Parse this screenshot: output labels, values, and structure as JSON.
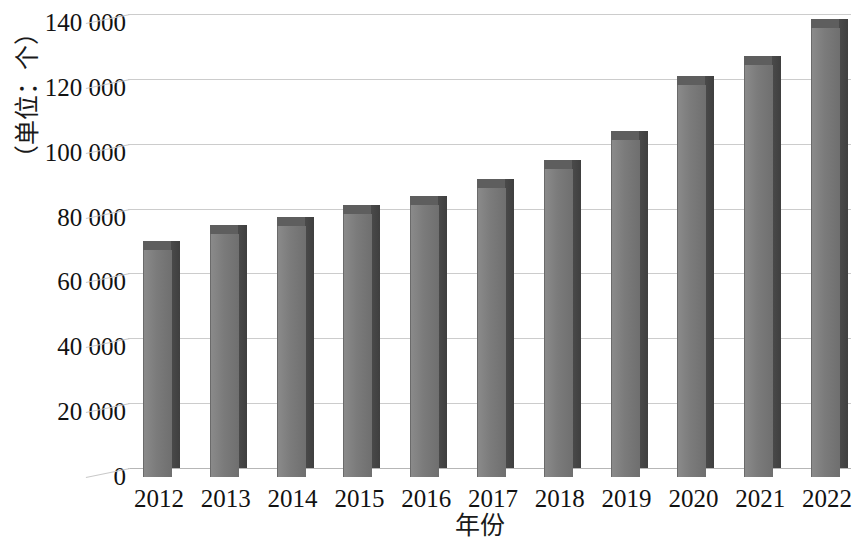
{
  "chart_data": {
    "type": "bar",
    "title": "",
    "xlabel": "年份",
    "ylabel": "（单位：个）",
    "categories": [
      "2012",
      "2013",
      "2014",
      "2015",
      "2016",
      "2017",
      "2018",
      "2019",
      "2020",
      "2021",
      "2022"
    ],
    "values": [
      70000,
      75000,
      77500,
      81000,
      84000,
      89000,
      95000,
      104000,
      121000,
      127000,
      138500
    ],
    "series": [
      {
        "name": "数量",
        "values": [
          70000,
          75000,
          77500,
          81000,
          84000,
          89000,
          95000,
          104000,
          121000,
          127000,
          138500
        ]
      }
    ],
    "ylim": [
      0,
      140000
    ],
    "ytick_values": [
      0,
      20000,
      40000,
      60000,
      80000,
      100000,
      120000,
      140000
    ],
    "ytick_labels": [
      "0",
      "20 000",
      "40 000",
      "60 000",
      "80 000",
      "100 000",
      "120 000",
      "140 000"
    ],
    "grid": true,
    "legend": "none",
    "style_3d": true,
    "colors": {
      "bar_front": "#7b7b7b",
      "bar_side": "#454545",
      "bar_top": "#5e5e5e",
      "gridline": "#cccccc",
      "text": "#121212",
      "background": "#ffffff"
    }
  },
  "axes": {
    "y_title": "（单位：个）",
    "x_title": "年份"
  }
}
